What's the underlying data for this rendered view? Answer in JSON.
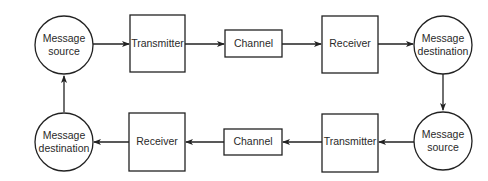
{
  "diagram": {
    "type": "communication-loop",
    "colors": {
      "stroke": "#222222",
      "text": "#2a2a2a",
      "background": "#ffffff"
    },
    "nodes": {
      "top_source": {
        "shape": "circle",
        "lines": [
          "Message",
          "source"
        ]
      },
      "top_transmitter": {
        "shape": "box",
        "label": "Transmitter"
      },
      "top_channel": {
        "shape": "box",
        "label": "Channel"
      },
      "top_receiver": {
        "shape": "box",
        "label": "Receiver"
      },
      "top_destination": {
        "shape": "circle",
        "lines": [
          "Message",
          "destination"
        ]
      },
      "bottom_source": {
        "shape": "circle",
        "lines": [
          "Message",
          "source"
        ]
      },
      "bottom_transmitter": {
        "shape": "box",
        "label": "Transmitter"
      },
      "bottom_channel": {
        "shape": "box",
        "label": "Channel"
      },
      "bottom_receiver": {
        "shape": "box",
        "label": "Receiver"
      },
      "bottom_destination": {
        "shape": "circle",
        "lines": [
          "Message",
          "destination"
        ]
      }
    },
    "edges": [
      {
        "from": "top_source",
        "to": "top_transmitter"
      },
      {
        "from": "top_transmitter",
        "to": "top_channel"
      },
      {
        "from": "top_channel",
        "to": "top_receiver"
      },
      {
        "from": "top_receiver",
        "to": "top_destination"
      },
      {
        "from": "top_destination",
        "to": "bottom_source"
      },
      {
        "from": "bottom_source",
        "to": "bottom_transmitter"
      },
      {
        "from": "bottom_transmitter",
        "to": "bottom_channel"
      },
      {
        "from": "bottom_channel",
        "to": "bottom_receiver"
      },
      {
        "from": "bottom_receiver",
        "to": "bottom_destination"
      },
      {
        "from": "bottom_destination",
        "to": "top_source"
      }
    ]
  }
}
